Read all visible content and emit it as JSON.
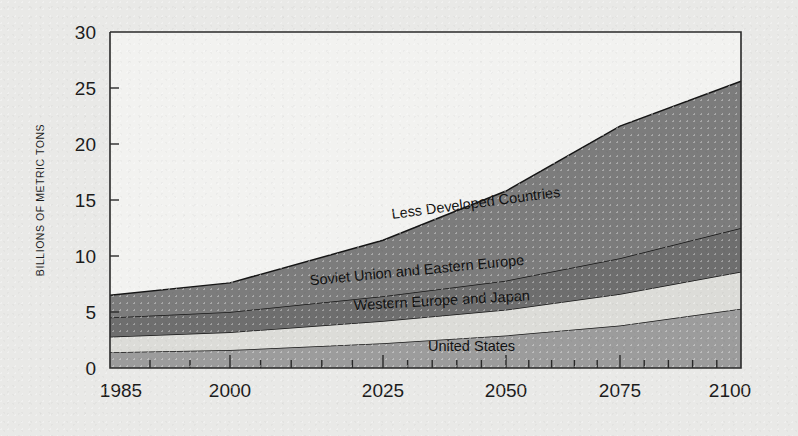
{
  "chart_data": {
    "type": "area",
    "title": "",
    "subtitle": "",
    "xlabel": "",
    "ylabel": "BILLIONS OF METRIC TONS",
    "x": [
      1985,
      2000,
      2025,
      2050,
      2075,
      2100
    ],
    "xlim": [
      1985,
      2100
    ],
    "ylim": [
      0,
      30
    ],
    "y_ticks": [
      0,
      5,
      10,
      15,
      20,
      25,
      30
    ],
    "x_ticks": [
      1985,
      2000,
      2025,
      2050,
      2075,
      2100
    ],
    "x_tick_labels": [
      "1985",
      "2000",
      "2025",
      "2050",
      "2075",
      "2100"
    ],
    "y_tick_labels": [
      "0",
      "5",
      "10",
      "15",
      "20",
      "25",
      "30"
    ],
    "grid": false,
    "legend_position": "inline-annotations",
    "stacked": true,
    "series": [
      {
        "name": "United States",
        "color": "#9c9c9c",
        "values": [
          1.4,
          1.6,
          2.2,
          2.9,
          3.8,
          5.3
        ],
        "label_x": 2043,
        "label_y": 1.5
      },
      {
        "name": "Western Europe and Japan",
        "color": "#dcdcd8",
        "values": [
          1.4,
          1.6,
          2.0,
          2.3,
          2.8,
          3.3
        ],
        "label_x": 2037,
        "label_y": 5.6
      },
      {
        "name": "Soviet Union and Eastern Europe",
        "color": "#6e6e6e",
        "values": [
          1.7,
          1.8,
          2.2,
          2.6,
          3.2,
          3.9
        ],
        "label_x": 2032,
        "label_y": 8.3
      },
      {
        "name": "Less Developed Countries",
        "color": "#7c7c7c",
        "values": [
          2.0,
          2.6,
          5.0,
          8.0,
          11.8,
          13.1
        ],
        "label_x": 2044,
        "label_y": 14.3
      }
    ],
    "cumulative_tops": {
      "United States": [
        1.4,
        1.6,
        2.2,
        2.9,
        3.8,
        5.3
      ],
      "Western Europe and Japan": [
        2.8,
        3.2,
        4.2,
        5.2,
        6.6,
        8.6
      ],
      "Soviet Union and Eastern Europe": [
        4.5,
        5.0,
        6.4,
        7.8,
        9.8,
        12.5
      ],
      "Total": [
        6.5,
        7.6,
        11.4,
        15.8,
        21.6,
        25.6
      ]
    },
    "annotations": [
      "Less Developed Countries",
      "Soviet Union and Eastern Europe",
      "Western Europe and Japan",
      "United States"
    ],
    "colors": {
      "background": "#e9e9e7",
      "plot_background": "#f2f2f0",
      "axis": "#2a2a2a",
      "text": "#1c1c1c"
    }
  }
}
